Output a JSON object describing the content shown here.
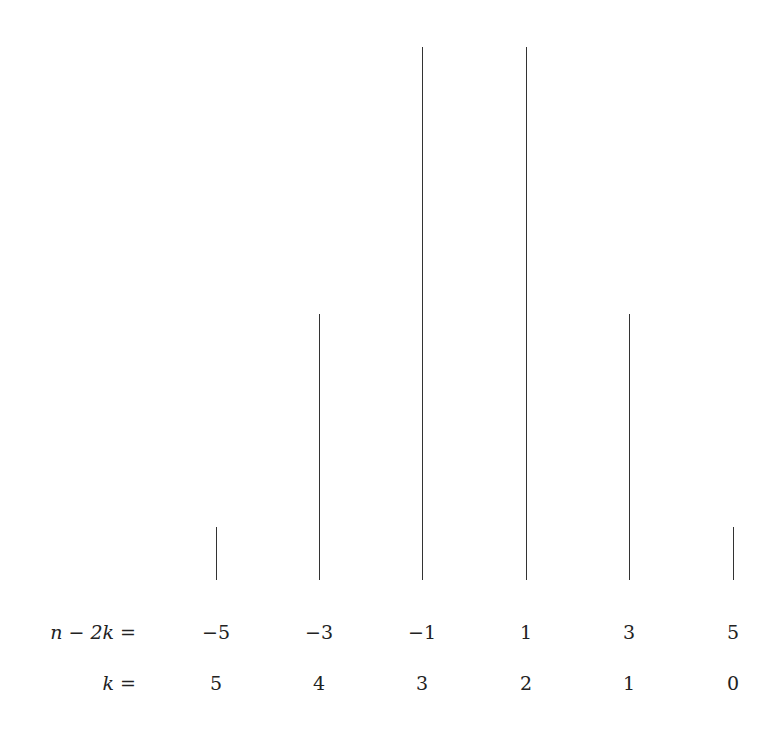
{
  "chart_data": {
    "type": "bar",
    "style": "stick plot (vertical lines)",
    "title": "",
    "xlabel": "",
    "ylabel": "",
    "categories": [
      "-5",
      "-3",
      "-1",
      "1",
      "3",
      "5"
    ],
    "values": [
      1,
      5,
      10,
      10,
      5,
      1
    ],
    "rows": [
      {
        "label": "n − 2k =",
        "values": [
          "−5",
          "−3",
          "−1",
          "1",
          "3",
          "5"
        ]
      },
      {
        "label": "k =",
        "values": [
          "5",
          "4",
          "3",
          "2",
          "1",
          "0"
        ]
      }
    ],
    "ylim": [
      0,
      10
    ],
    "grid": false,
    "legend": null
  },
  "labels": {
    "row1": "n − 2k =",
    "row2": "k ="
  }
}
